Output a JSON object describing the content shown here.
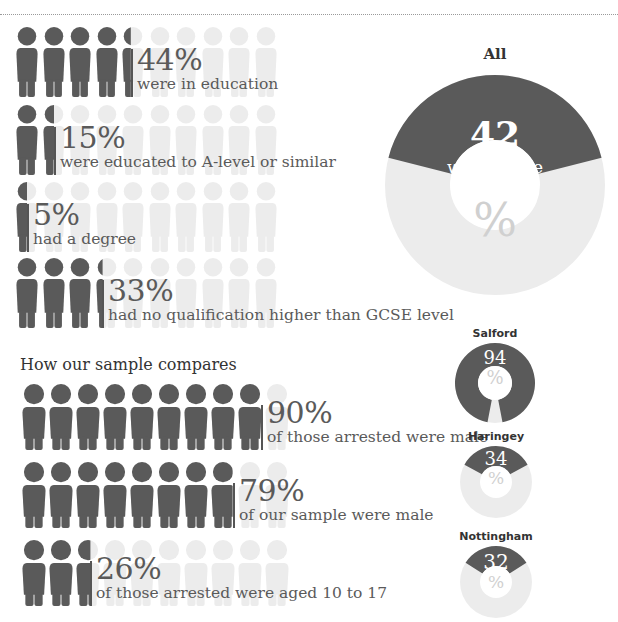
{
  "chart_data": [
    {
      "type": "pictogram",
      "title": "Education of sample",
      "icons_per_row": 10,
      "rows": [
        {
          "value": 44,
          "label": "were in education"
        },
        {
          "value": 15,
          "label": "were educated to A-level or similar"
        },
        {
          "value": 5,
          "label": "had a degree"
        },
        {
          "value": 33,
          "label": "had no qualification higher than GCSE level"
        }
      ]
    },
    {
      "type": "pie",
      "title": "All",
      "value": 42,
      "label": "were white",
      "unit": "%"
    },
    {
      "type": "pictogram",
      "title": "How our sample compares",
      "icons_per_row": 10,
      "rows": [
        {
          "value": 90,
          "label": "of those arrested were male"
        },
        {
          "value": 79,
          "label": "of our sample were male"
        },
        {
          "value": 26,
          "label": "of those arrested were aged 10 to 17"
        }
      ]
    },
    {
      "type": "pie",
      "series": [
        {
          "name": "Salford",
          "value": 94
        },
        {
          "name": "Haringey",
          "value": 34
        },
        {
          "name": "Nottingham",
          "value": 32
        }
      ],
      "unit": "%"
    }
  ],
  "colors": {
    "dark": "#5a5a5a",
    "light": "#ececec",
    "divider": "#555555"
  },
  "top": {
    "rows": [
      {
        "pct": "44%",
        "desc": "were in education"
      },
      {
        "pct": "15%",
        "desc": "were educated to A-level or similar"
      },
      {
        "pct": "5%",
        "desc": "had a degree"
      },
      {
        "pct": "33%",
        "desc": "had no qualification higher than GCSE level"
      }
    ]
  },
  "all_donut": {
    "title": "All",
    "number": "42",
    "sub": "were white",
    "pct_symbol": "%"
  },
  "compare": {
    "title": "How our sample compares",
    "rows": [
      {
        "pct": "90%",
        "desc": "of those arrested were male"
      },
      {
        "pct": "79%",
        "desc": "of our sample were male"
      },
      {
        "pct": "26%",
        "desc": "of those arrested were aged 10 to 17"
      }
    ]
  },
  "city_donuts": [
    {
      "title": "Salford",
      "number": "94",
      "pct_symbol": "%"
    },
    {
      "title": "Haringey",
      "number": "34",
      "pct_symbol": "%"
    },
    {
      "title": "Nottingham",
      "number": "32",
      "pct_symbol": "%"
    }
  ]
}
